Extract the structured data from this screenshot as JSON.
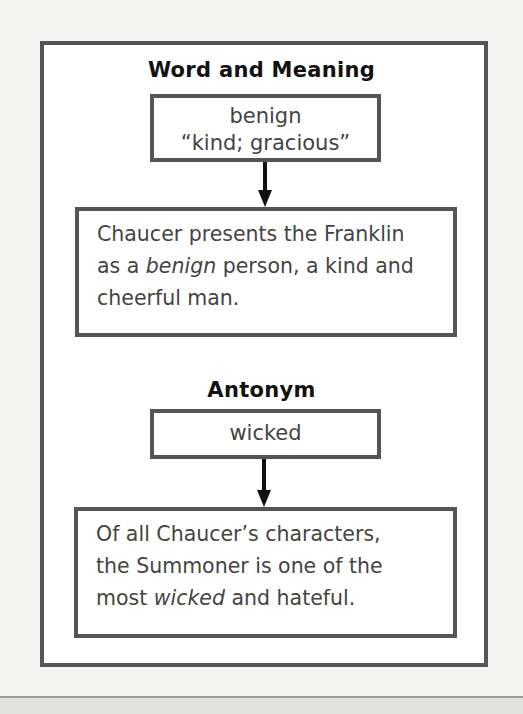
{
  "word_section": {
    "heading": "Word and Meaning",
    "word": "benign",
    "meaning": "“kind; gracious”",
    "example": {
      "line1": "Chaucer presents the Franklin",
      "line2_pre": "as a ",
      "line2_em": "benign",
      "line2_post": " person, a kind and",
      "line3": "cheerful man."
    }
  },
  "antonym_section": {
    "heading": "Antonym",
    "word": "wicked",
    "example": {
      "line1": "Of all Chaucer’s characters,",
      "line2": "the Summoner is one of the",
      "line3_pre": "most ",
      "line3_em": "wicked",
      "line3_post": " and hateful."
    }
  },
  "colors": {
    "frame_border": "#555555",
    "body_text": "#444444",
    "heading_text": "#111111",
    "arrow": "#111111"
  }
}
